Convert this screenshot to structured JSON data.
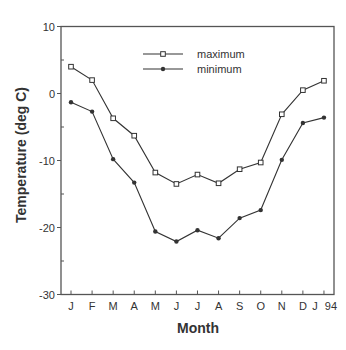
{
  "chart_data": {
    "type": "line",
    "title": "",
    "xlabel": "Month",
    "ylabel": "Temperature  (deg  C)",
    "categories": [
      "J",
      "F",
      "M",
      "A",
      "M",
      "J",
      "J",
      "A",
      "S",
      "O",
      "N",
      "D",
      "J 94"
    ],
    "x_tick_labels": [
      "J",
      "F",
      "M",
      "A",
      "M",
      "J",
      "J",
      "A",
      "S",
      "O",
      "N",
      "D",
      "J",
      "94"
    ],
    "y_ticks": [
      10,
      0,
      -10,
      -20,
      -30
    ],
    "ylim": [
      -30,
      10
    ],
    "grid": false,
    "legend_position": "upper center",
    "series": [
      {
        "name": "maximum",
        "marker": "open-square",
        "values": [
          4.0,
          2.0,
          -3.7,
          -6.3,
          -11.8,
          -13.5,
          -12.1,
          -13.4,
          -11.3,
          -10.3,
          -3.1,
          0.5,
          1.9
        ]
      },
      {
        "name": "minimum",
        "marker": "filled-circle",
        "values": [
          -1.3,
          -2.7,
          -9.8,
          -13.3,
          -20.6,
          -22.1,
          -20.4,
          -21.6,
          -18.6,
          -17.4,
          -9.9,
          -4.4,
          -3.6
        ]
      }
    ]
  },
  "colors": {
    "line": "#333333",
    "axis": "#555555",
    "background": "#ffffff"
  }
}
